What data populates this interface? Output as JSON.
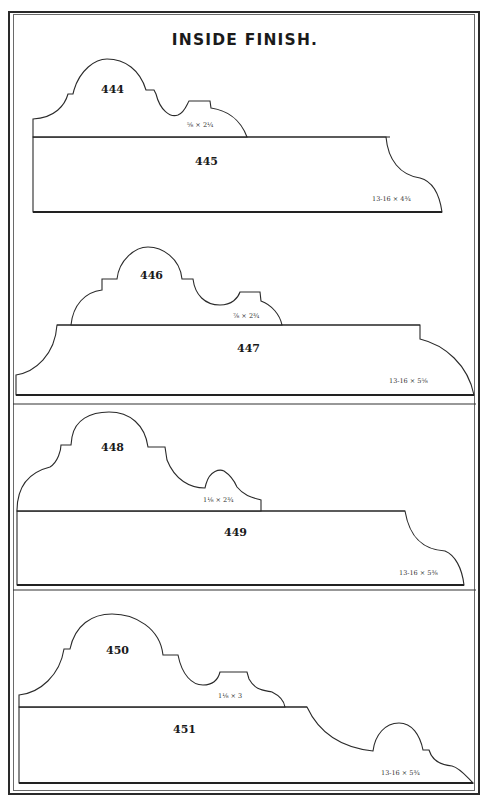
{
  "page": {
    "title": "INSIDE FINISH."
  },
  "profiles": [
    {
      "number": "444",
      "size": "⅝ × 2¼"
    },
    {
      "number": "445",
      "size": "13-16 × 4¾"
    },
    {
      "number": "446",
      "size": "⅞ × 2¾"
    },
    {
      "number": "447",
      "size": "13-16 × 5⅝"
    },
    {
      "number": "448",
      "size": "1⅛ × 2¾"
    },
    {
      "number": "449",
      "size": "13-16 × 5⅜"
    },
    {
      "number": "450",
      "size": "1⅛ × 3"
    },
    {
      "number": "451",
      "size": "13-16 × 5¾"
    }
  ]
}
